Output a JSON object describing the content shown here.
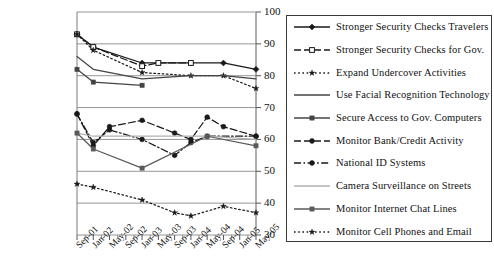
{
  "chart_data": {
    "type": "line",
    "title": "",
    "xlabel": "",
    "ylabel": "",
    "ylim": [
      30,
      100
    ],
    "yticks": [
      30,
      40,
      50,
      60,
      70,
      80,
      90,
      100
    ],
    "grid": true,
    "legend_position": "right",
    "x": [
      "Sep-01",
      "Jan-02",
      "May-02",
      "Sep-02",
      "Jan-03",
      "May-03",
      "Sep-03",
      "Jan-04",
      "May-04",
      "Sep-04",
      "Jan-05",
      "May-05"
    ],
    "categories": [
      "Sep-01",
      "Jan-02",
      "May-02",
      "Sep-02",
      "Jan-03",
      "May-03",
      "Sep-03",
      "Jan-04",
      "May-04",
      "Sep-04",
      "Jan-05",
      "May-05"
    ],
    "series": [
      {
        "name": "Stronger Security Checks Travelers",
        "marker": "diamond-filled",
        "line": "solid",
        "color": "#1a1a1a",
        "x": [
          "Sep-01",
          "Jan-02",
          "Jan-03",
          "Jan-04",
          "Sep-04",
          "May-05"
        ],
        "values": [
          93,
          89,
          84,
          84,
          84,
          82
        ]
      },
      {
        "name": "Stronger Security Checks for Gov.",
        "marker": "square-open",
        "line": "dashed",
        "color": "#1a1a1a",
        "x": [
          "Sep-01",
          "Jan-02",
          "Jan-03",
          "May-03",
          "Jan-04"
        ],
        "values": [
          93,
          89,
          83,
          84,
          84
        ]
      },
      {
        "name": "Expand Undercover Activities",
        "marker": "star",
        "line": "dotted",
        "color": "#1a1a1a",
        "x": [
          "Sep-01",
          "Jan-02",
          "Jan-03",
          "Jan-04",
          "Sep-04",
          "May-05"
        ],
        "values": [
          93,
          88,
          81,
          80,
          80,
          76
        ]
      },
      {
        "name": "Use Facial Recognition Technology",
        "marker": "none",
        "line": "solid",
        "color": "#444444",
        "x": [
          "Sep-01",
          "Jan-02",
          "Jan-03",
          "Jan-04",
          "Sep-04",
          "May-05"
        ],
        "values": [
          86,
          82,
          79,
          80,
          80,
          79
        ]
      },
      {
        "name": "Secure Access to Gov. Computers",
        "marker": "square-filled",
        "line": "solid",
        "color": "#444444",
        "x": [
          "Sep-01",
          "Jan-02",
          "Jan-03"
        ],
        "values": [
          82,
          78,
          77
        ]
      },
      {
        "name": "Monitor Bank/Credit Activity",
        "marker": "circle-filled",
        "line": "dashed",
        "color": "#1a1a1a",
        "x": [
          "Sep-01",
          "Jan-02",
          "May-02",
          "Jan-03",
          "Sep-03",
          "Jan-04",
          "May-04",
          "Sep-04",
          "May-05"
        ],
        "values": [
          68,
          58,
          64,
          66,
          62,
          60,
          67,
          64,
          61
        ]
      },
      {
        "name": "National ID Systems",
        "marker": "circle-filled",
        "line": "dash-dot",
        "color": "#1a1a1a",
        "x": [
          "Sep-01",
          "Jan-02",
          "May-02",
          "Jan-03",
          "Sep-03",
          "Jan-04",
          "May-04",
          "May-05"
        ],
        "values": [
          68,
          59,
          63,
          60,
          55,
          59,
          61,
          61
        ]
      },
      {
        "name": "Camera Surveillance on Streets",
        "marker": "none",
        "line": "solid",
        "color": "#b0b0b0",
        "x": [
          "Sep-01",
          "Jan-02",
          "Jan-03",
          "May-04",
          "May-05"
        ],
        "values": [
          62,
          61,
          61,
          61,
          60
        ]
      },
      {
        "name": "Monitor Internet Chat Lines",
        "marker": "square-filled",
        "line": "solid",
        "color": "#5a5a5a",
        "x": [
          "Sep-01",
          "Jan-02",
          "Jan-03",
          "May-04",
          "May-05"
        ],
        "values": [
          62,
          57,
          51,
          61,
          58
        ]
      },
      {
        "name": "Monitor Cell Phones and Email",
        "marker": "star",
        "line": "dotted",
        "color": "#1a1a1a",
        "x": [
          "Sep-01",
          "Jan-02",
          "Jan-03",
          "Sep-03",
          "Jan-04",
          "Sep-04",
          "May-05"
        ],
        "values": [
          46,
          45,
          41,
          37,
          36,
          39,
          37
        ]
      }
    ]
  },
  "axis": {
    "y_labels": [
      "100",
      "90",
      "80",
      "70",
      "60",
      "50",
      "40",
      "30"
    ],
    "x_labels": [
      "Sep-01",
      "Jan-02",
      "May-02",
      "Sep-02",
      "Jan-03",
      "May-03",
      "Sep-03",
      "Jan-04",
      "May-04",
      "Sep-04",
      "Jan-05",
      "May-05"
    ]
  },
  "legend": {
    "items": [
      {
        "label": "Stronger Security Checks Travelers"
      },
      {
        "label": "Stronger Security Checks for Gov."
      },
      {
        "label": "Expand Undercover Activities"
      },
      {
        "label": "Use Facial Recognition Technology"
      },
      {
        "label": "Secure Access to Gov. Computers"
      },
      {
        "label": "Monitor Bank/Credit Activity"
      },
      {
        "label": "National ID Systems"
      },
      {
        "label": "Camera Surveillance on Streets"
      },
      {
        "label": "Monitor Internet Chat Lines"
      },
      {
        "label": "Monitor Cell Phones and Email"
      }
    ]
  }
}
